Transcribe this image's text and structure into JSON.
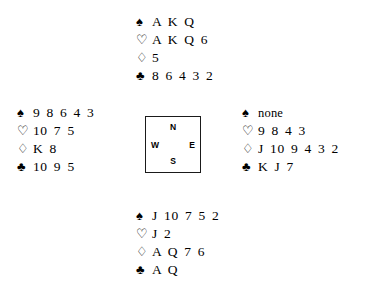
{
  "diagram": {
    "type": "bridge-hand-diagram",
    "background_color": "#ffffff",
    "text_color": "#000000"
  },
  "suits": {
    "spade_symbol": "♠",
    "heart_symbol": "♡",
    "diamond_symbol": "♢",
    "club_symbol": "♣",
    "spade_name": "spade-suit-icon",
    "heart_name": "heart-suit-icon",
    "diamond_name": "diamond-suit-icon",
    "club_name": "club-suit-icon"
  },
  "compass": {
    "north": "N",
    "east": "E",
    "south": "S",
    "west": "W"
  },
  "hands": {
    "north": {
      "label": "North",
      "spades": "A K Q",
      "hearts": "A K Q 6",
      "diamonds": "5",
      "clubs": "8 6 4 3 2"
    },
    "west": {
      "label": "West",
      "spades": "9 8 6 4 3",
      "hearts": "10 7 5",
      "diamonds": "K 8",
      "clubs": "10 9 5"
    },
    "east": {
      "label": "East",
      "spades": "none",
      "hearts": "9 8 4 3",
      "diamonds": "J 10 9 4 3 2",
      "clubs": "K J 7"
    },
    "south": {
      "label": "South",
      "spades": "J 10 7 5 2",
      "hearts": "J 2",
      "diamonds": "A Q 7 6",
      "clubs": "A Q"
    }
  }
}
